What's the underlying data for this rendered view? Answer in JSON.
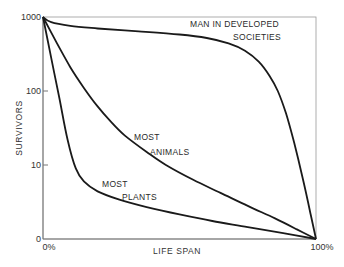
{
  "chart_data": {
    "type": "line",
    "title": "",
    "xlabel": "LIFE SPAN",
    "ylabel": "SURVIVORS",
    "yscale": "log",
    "xlim": [
      0,
      100
    ],
    "ylim": [
      1,
      1000
    ],
    "x_ticks": [
      {
        "value": 0,
        "label": "0%"
      },
      {
        "value": 100,
        "label": "100%"
      }
    ],
    "y_ticks": [
      {
        "value": 1000,
        "label": "1000"
      },
      {
        "value": 100,
        "label": "100"
      },
      {
        "value": 10,
        "label": "10"
      },
      {
        "value": 1,
        "label": "0"
      }
    ],
    "grid": false,
    "series": [
      {
        "name": "MAN IN DEVELOPED SOCIETIES",
        "label_lines": [
          "MAN IN DEVELOPED",
          "SOCIETIES"
        ],
        "x": [
          0,
          3,
          10,
          20,
          35,
          50,
          60,
          68,
          74,
          79,
          83,
          86,
          89,
          92,
          95,
          98,
          100
        ],
        "y": [
          1000,
          850,
          760,
          700,
          640,
          580,
          520,
          440,
          350,
          250,
          160,
          100,
          50,
          20,
          7,
          2.2,
          1
        ]
      },
      {
        "name": "MOST ANIMALS",
        "label_lines": [
          "MOST",
          "ANIMALS"
        ],
        "x": [
          0,
          5,
          10,
          15,
          20,
          25,
          30,
          38,
          45,
          55,
          65,
          75,
          85,
          93,
          100
        ],
        "y": [
          1000,
          450,
          210,
          110,
          62,
          38,
          25,
          15,
          10,
          6.3,
          4.2,
          2.8,
          1.9,
          1.35,
          1
        ]
      },
      {
        "name": "MOST PLANTS",
        "label_lines": [
          "MOST",
          "PLANTS"
        ],
        "x": [
          0,
          3,
          6,
          9,
          12,
          15,
          20,
          28,
          38,
          50,
          62,
          75,
          88,
          100
        ],
        "y": [
          1000,
          280,
          80,
          22,
          9,
          6,
          4.4,
          3.4,
          2.7,
          2.15,
          1.75,
          1.45,
          1.2,
          1
        ]
      }
    ],
    "annotations": [
      {
        "text_lines": [
          "MAN IN DEVELOPED",
          "SOCIETIES"
        ],
        "series": "MAN IN DEVELOPED SOCIETIES"
      },
      {
        "text_lines": [
          "MOST",
          "ANIMALS"
        ],
        "series": "MOST ANIMALS"
      },
      {
        "text_lines": [
          "MOST",
          "PLANTS"
        ],
        "series": "MOST PLANTS"
      }
    ],
    "colors": {
      "line": "#1a1a1a",
      "axis": "#8a8a8a",
      "text": "#2a2a2a"
    }
  }
}
